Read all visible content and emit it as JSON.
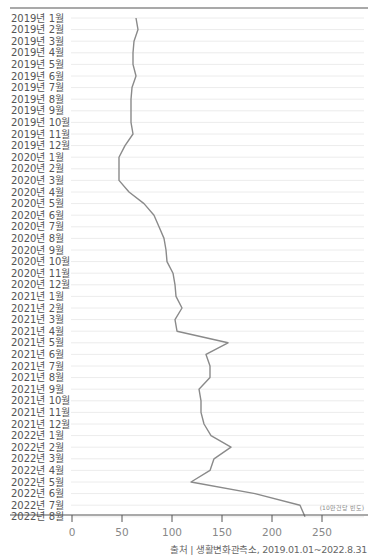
{
  "chart_data": {
    "type": "line",
    "orientation": "horizontal-values-vertical-time",
    "title": "",
    "xlabel": "",
    "ylabel": "",
    "unit_note": "(10만건당 빈도)",
    "source": "출처 | 생활변화관측소, 2019.01.01~2022.8.31",
    "xlim": [
      0,
      290
    ],
    "xticks": [
      0,
      50,
      100,
      150,
      200,
      250
    ],
    "grid": true,
    "line_color": "#8a8a8a",
    "categories": [
      "2019년 1월",
      "2019년 2월",
      "2019년 3월",
      "2019년 4월",
      "2019년 5월",
      "2019년 6월",
      "2019년 7월",
      "2019년 8월",
      "2019년 9월",
      "2019년 10월",
      "2019년 11월",
      "2019년 12월",
      "2020년 1월",
      "2020년 2월",
      "2020년 3월",
      "2020년 4월",
      "2020년 5월",
      "2020년 6월",
      "2020년 7월",
      "2020년 8월",
      "2020년 9월",
      "2020년 10월",
      "2020년 11월",
      "2020년 12월",
      "2021년 1월",
      "2021년 2월",
      "2021년 3월",
      "2021년 4월",
      "2021년 5월",
      "2021년 6월",
      "2021년 7월",
      "2021년 8월",
      "2021년 9월",
      "2021년 10월",
      "2021년 11월",
      "2021년 12월",
      "2022년 1월",
      "2022년 2월",
      "2022년 3월",
      "2022년 4월",
      "2022년 5월",
      "2022년 6월",
      "2022년 7월",
      "2022년 8월"
    ],
    "series": [
      {
        "name": "10만건당 빈도",
        "values": [
          64,
          66,
          62,
          61,
          61,
          64,
          60,
          59,
          59,
          59,
          61,
          53,
          47,
          47,
          47,
          57,
          72,
          82,
          87,
          92,
          94,
          95,
          101,
          103,
          104,
          110,
          103,
          105,
          156,
          134,
          138,
          138,
          127,
          129,
          129,
          132,
          139,
          159,
          142,
          138,
          119,
          183,
          228,
          233
        ]
      }
    ]
  }
}
